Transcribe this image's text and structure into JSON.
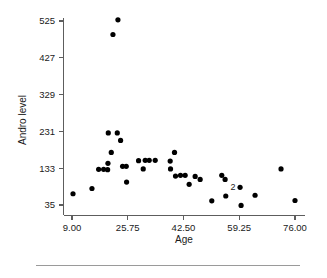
{
  "figure": {
    "background_color": "#ffffff",
    "axis_color": "#5d5d5d",
    "point_color": "#000000",
    "footer_rule_color": "#9a9a9a"
  },
  "chart_data": {
    "type": "scatter",
    "title": "",
    "xlabel": "Age",
    "ylabel": "Andro level",
    "xlim": [
      5.0,
      79.0
    ],
    "ylim": [
      8.0,
      560.0
    ],
    "grid": false,
    "legend": null,
    "xticks": [
      9.0,
      25.75,
      42.5,
      59.25,
      76.0
    ],
    "xticklabels": [
      "9.00",
      "25.75",
      "42.50",
      "59.25",
      "76.00"
    ],
    "yticks": [
      35,
      133,
      231,
      329,
      427,
      525
    ],
    "yticklabels": [
      "35",
      "133",
      "231",
      "329",
      "427",
      "525"
    ],
    "annotations": [
      {
        "text": "2",
        "x": 59.5,
        "y": 82,
        "note": "count label marking two coincident points"
      }
    ],
    "points": [
      {
        "x": 9.3,
        "y": 65
      },
      {
        "x": 15.0,
        "y": 79
      },
      {
        "x": 17.0,
        "y": 130
      },
      {
        "x": 18.5,
        "y": 130
      },
      {
        "x": 19.7,
        "y": 129
      },
      {
        "x": 19.8,
        "y": 146
      },
      {
        "x": 19.9,
        "y": 227
      },
      {
        "x": 20.8,
        "y": 175
      },
      {
        "x": 21.3,
        "y": 489
      },
      {
        "x": 22.6,
        "y": 227
      },
      {
        "x": 22.8,
        "y": 528
      },
      {
        "x": 23.6,
        "y": 207
      },
      {
        "x": 24.2,
        "y": 138
      },
      {
        "x": 25.3,
        "y": 138
      },
      {
        "x": 25.4,
        "y": 96
      },
      {
        "x": 29.0,
        "y": 153
      },
      {
        "x": 30.4,
        "y": 131
      },
      {
        "x": 31.0,
        "y": 154
      },
      {
        "x": 32.2,
        "y": 154
      },
      {
        "x": 34.0,
        "y": 154
      },
      {
        "x": 38.5,
        "y": 152
      },
      {
        "x": 38.6,
        "y": 131
      },
      {
        "x": 39.8,
        "y": 175
      },
      {
        "x": 40.1,
        "y": 112
      },
      {
        "x": 41.6,
        "y": 114
      },
      {
        "x": 43.0,
        "y": 114
      },
      {
        "x": 44.2,
        "y": 90
      },
      {
        "x": 46.0,
        "y": 111
      },
      {
        "x": 47.5,
        "y": 103
      },
      {
        "x": 51.0,
        "y": 46
      },
      {
        "x": 54.0,
        "y": 114
      },
      {
        "x": 55.0,
        "y": 103
      },
      {
        "x": 55.2,
        "y": 59
      },
      {
        "x": 59.8,
        "y": 34
      },
      {
        "x": 59.5,
        "y": 82
      },
      {
        "x": 64.0,
        "y": 61
      },
      {
        "x": 71.8,
        "y": 131
      },
      {
        "x": 76.0,
        "y": 47
      }
    ]
  }
}
